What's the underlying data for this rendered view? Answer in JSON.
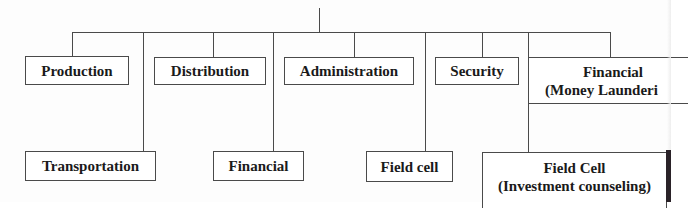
{
  "diagram": {
    "type": "org-chart",
    "nodes": {
      "production": {
        "label": "Production"
      },
      "distribution": {
        "label": "Distribution"
      },
      "administration": {
        "label": "Administration"
      },
      "security": {
        "label": "Security"
      },
      "financial_ml": {
        "line1": "Financial",
        "line2": "(Money Launderi"
      },
      "transportation": {
        "label": "Transportation"
      },
      "financial": {
        "label": "Financial"
      },
      "field_cell": {
        "label": "Field cell"
      },
      "field_cell_ic": {
        "line1": "Field Cell",
        "line2": "(Investment counseling)"
      }
    },
    "edges": [
      [
        "root",
        "production"
      ],
      [
        "root",
        "distribution"
      ],
      [
        "root",
        "administration"
      ],
      [
        "root",
        "security"
      ],
      [
        "root",
        "financial_ml"
      ],
      [
        "root",
        "transportation"
      ],
      [
        "root",
        "financial"
      ],
      [
        "root",
        "field_cell"
      ],
      [
        "root",
        "field_cell_ic"
      ]
    ],
    "colors": {
      "line": "#4a4a4a",
      "text": "#1a1a1a",
      "box_fill": "#ffffff"
    }
  }
}
